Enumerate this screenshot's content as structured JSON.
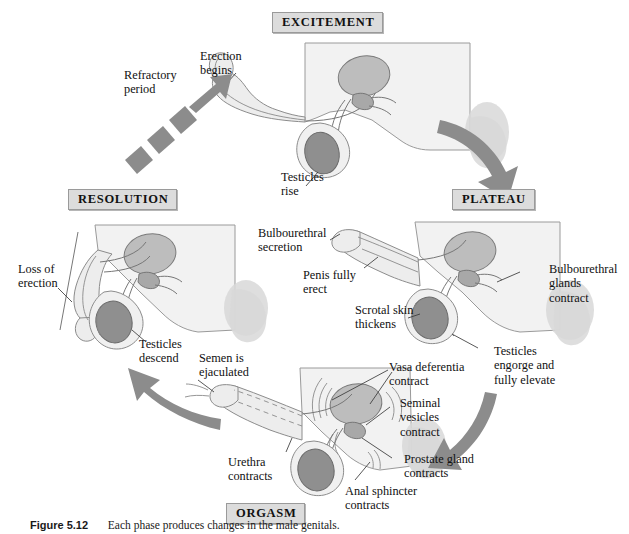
{
  "figure": {
    "caption_label": "Figure 5.12",
    "caption_text": "Each phase produces changes in the male genitals."
  },
  "phases": [
    {
      "id": "excitement",
      "label": "EXCITEMENT"
    },
    {
      "id": "plateau",
      "label": "PLATEAU"
    },
    {
      "id": "orgasm",
      "label": "ORGASM"
    },
    {
      "id": "resolution",
      "label": "RESOLUTION"
    }
  ],
  "annotations": {
    "refractory_period": "Refractory\nperiod",
    "erection_begins": "Erection\nbegins",
    "testicles_rise": "Testicles\nrise",
    "bulbourethral_secretion": "Bulbourethral\nsecretion",
    "penis_fully_erect": "Penis fully\nerect",
    "scrotal_skin_thickens": "Scrotal skin\nthickens",
    "bulbourethral_glands_contract": "Bulbourethral\nglands\ncontract",
    "testicles_engorge": "Testicles\nengorge and\nfully elevate",
    "vasa_deferentia_contract": "Vasa deferentia\ncontract",
    "seminal_vesicles_contract": "Seminal\nvesicles\ncontract",
    "prostate_gland_contracts": "Prostate gland\ncontracts",
    "anal_sphincter_contracts": "Anal sphincter\ncontracts",
    "urethra_contracts": "Urethra\ncontracts",
    "semen_is_ejaculated": "Semen is\nejaculated",
    "testicles_descend": "Testicles\ndescend",
    "loss_of_erection": "Loss of\nerection"
  },
  "colors": {
    "arrow_gray": "#8c8c8c",
    "box_fill": "#dcdcdc",
    "box_border": "#9a9a9a",
    "organ_light": "#e9e9e9",
    "organ_mid": "#cfcfcf",
    "organ_dark": "#9e9e9e",
    "outline": "#6e6e6e",
    "text": "#111111",
    "background": "#ffffff"
  }
}
